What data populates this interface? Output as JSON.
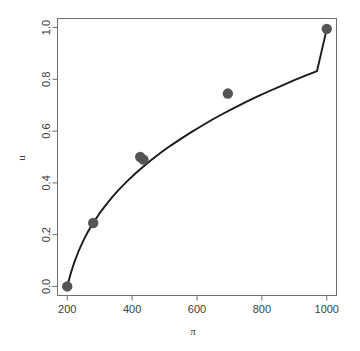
{
  "chart_data": {
    "type": "scatter",
    "title": "",
    "xlabel": "π",
    "ylabel": "u",
    "xlim": [
      170,
      1030
    ],
    "ylim": [
      -0.035,
      1.035
    ],
    "xticks": [
      200,
      400,
      600,
      800,
      1000
    ],
    "xtick_labels": [
      "200",
      "400",
      "600",
      "800",
      "1000"
    ],
    "yticks": [
      0.0,
      0.2,
      0.4,
      0.6,
      0.8,
      1.0
    ],
    "ytick_labels": [
      "0.0",
      "0.2",
      "0.4",
      "0.6",
      "0.8",
      "1.0"
    ],
    "grid": false,
    "legend": null,
    "box": true,
    "series": [
      {
        "name": "points",
        "kind": "scatter",
        "marker": "filled-circle",
        "color": "#555555",
        "size": 5.2,
        "x": [
          200,
          280,
          425,
          435,
          695,
          1000
        ],
        "y": [
          0.0,
          0.245,
          0.5,
          0.49,
          0.745,
          0.995
        ]
      },
      {
        "name": "fitted-curve",
        "kind": "line",
        "color": "#1a1a1a",
        "width": 1.9,
        "x": [
          200,
          210,
          222,
          235,
          250,
          265,
          280,
          300,
          320,
          340,
          360,
          385,
          410,
          435,
          460,
          490,
          520,
          550,
          580,
          610,
          645,
          680,
          715,
          750,
          785,
          820,
          860,
          900,
          940,
          970,
          1000
        ],
        "y": [
          0.0,
          0.047,
          0.094,
          0.136,
          0.178,
          0.214,
          0.246,
          0.283,
          0.316,
          0.347,
          0.375,
          0.407,
          0.436,
          0.463,
          0.489,
          0.518,
          0.545,
          0.57,
          0.594,
          0.617,
          0.643,
          0.667,
          0.69,
          0.712,
          0.733,
          0.753,
          0.775,
          0.797,
          0.817,
          0.832,
          0.995
        ]
      }
    ]
  },
  "axis": {
    "x_title": "π",
    "y_title": "u"
  }
}
